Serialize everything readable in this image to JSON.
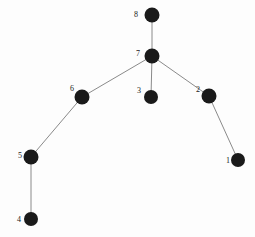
{
  "figure": {
    "kind": "node-link-graph",
    "background_color": "#fdfdfd",
    "node_color": "#1a1a1a",
    "edge_color": "#8a8a8a",
    "label_color": "#1a1a1a",
    "width": 255,
    "height": 237
  },
  "graph_data": {
    "type": "graph",
    "directed": false,
    "node_count": 8,
    "edge_count": 7,
    "nodes": [
      {
        "id": "1",
        "label": "1",
        "x": 238,
        "y": 160,
        "r": 7,
        "label_x": 228,
        "label_y": 161
      },
      {
        "id": "2",
        "label": "2",
        "x": 209,
        "y": 96,
        "r": 7.5,
        "label_x": 198,
        "label_y": 90
      },
      {
        "id": "3",
        "label": "3",
        "x": 151,
        "y": 97,
        "r": 7,
        "label_x": 139,
        "label_y": 91
      },
      {
        "id": "4",
        "label": "4",
        "x": 31,
        "y": 219,
        "r": 7,
        "label_x": 19,
        "label_y": 220
      },
      {
        "id": "5",
        "label": "5",
        "x": 31,
        "y": 157,
        "r": 7.5,
        "label_x": 20,
        "label_y": 156
      },
      {
        "id": "6",
        "label": "6",
        "x": 82,
        "y": 97,
        "r": 7.5,
        "label_x": 72,
        "label_y": 89
      },
      {
        "id": "7",
        "label": "7",
        "x": 152,
        "y": 56,
        "r": 7.5,
        "label_x": 138,
        "label_y": 54
      },
      {
        "id": "8",
        "label": "8",
        "x": 152,
        "y": 15,
        "r": 7.5,
        "label_x": 136,
        "label_y": 15
      }
    ],
    "edges": [
      {
        "source": "8",
        "target": "7"
      },
      {
        "source": "7",
        "target": "6"
      },
      {
        "source": "7",
        "target": "3"
      },
      {
        "source": "7",
        "target": "2"
      },
      {
        "source": "6",
        "target": "5"
      },
      {
        "source": "5",
        "target": "4"
      },
      {
        "source": "2",
        "target": "1"
      }
    ]
  }
}
